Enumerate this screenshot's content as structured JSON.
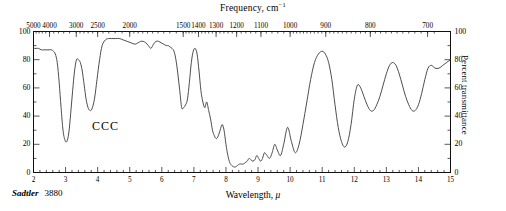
{
  "titles": {
    "top_axis": "Frequency, cm",
    "top_axis_sup": "−1",
    "bottom_axis": "Wavelength, ",
    "bottom_axis_unit": "μ",
    "right_axis": "Percent transmittance"
  },
  "credit": {
    "source": "Sadtler",
    "number": "3880"
  },
  "annotation": {
    "sample_label": "CCC"
  },
  "axes": {
    "y_ticks": [
      "0",
      "20",
      "40",
      "60",
      "80",
      "100"
    ],
    "y_left_labels": [
      "100",
      "80",
      "60",
      "40",
      "20",
      "0"
    ],
    "y_right_labels": [
      "100",
      "80",
      "60",
      "40",
      "20",
      "0"
    ],
    "x_bottom_labels": [
      "2",
      "3",
      "4",
      "5",
      "6",
      "7",
      "8",
      "9",
      "10",
      "11",
      "12",
      "13",
      "14",
      "15"
    ],
    "x_top_labels": [
      "5000",
      "4000",
      "3000",
      "2500",
      "2000",
      "1500",
      "1400",
      "1300",
      "1200",
      "1100",
      "1000",
      "900",
      "800",
      "700"
    ]
  },
  "chart_data": {
    "type": "line",
    "xlabel": "Wavelength, μ",
    "ylabel": "Percent transmittance",
    "x_top_label": "Frequency, cm−1",
    "xlim": [
      2,
      15
    ],
    "ylim": [
      0,
      100
    ],
    "grid": false,
    "legend": null,
    "x_axis_scale": "linear-wavelength",
    "top_axis_ticks_cm1": [
      5000,
      4000,
      3000,
      2500,
      2000,
      1500,
      1400,
      1300,
      1200,
      1100,
      1000,
      900,
      800,
      700
    ],
    "bottom_axis_ticks_um": [
      2,
      3,
      4,
      5,
      6,
      7,
      8,
      9,
      10,
      11,
      12,
      13,
      14,
      15
    ],
    "series": [
      {
        "name": "transmittance",
        "x": [
          2.0,
          2.08,
          2.16,
          2.24,
          2.32,
          2.4,
          2.48,
          2.56,
          2.62,
          2.68,
          2.74,
          2.8,
          2.86,
          2.92,
          2.98,
          3.04,
          3.1,
          3.16,
          3.22,
          3.28,
          3.34,
          3.4,
          3.46,
          3.52,
          3.58,
          3.64,
          3.7,
          3.76,
          3.82,
          3.9,
          3.98,
          4.06,
          4.14,
          4.24,
          4.34,
          4.44,
          4.56,
          4.68,
          4.8,
          4.92,
          5.04,
          5.16,
          5.26,
          5.34,
          5.42,
          5.5,
          5.58,
          5.66,
          5.74,
          5.82,
          5.9,
          5.98,
          6.06,
          6.14,
          6.2,
          6.26,
          6.32,
          6.38,
          6.44,
          6.5,
          6.56,
          6.62,
          6.68,
          6.74,
          6.8,
          6.86,
          6.92,
          6.98,
          7.04,
          7.1,
          7.16,
          7.22,
          7.28,
          7.34,
          7.4,
          7.46,
          7.52,
          7.58,
          7.64,
          7.7,
          7.76,
          7.82,
          7.88,
          7.94,
          8.0,
          8.06,
          8.12,
          8.18,
          8.24,
          8.3,
          8.36,
          8.42,
          8.48,
          8.54,
          8.6,
          8.66,
          8.72,
          8.78,
          8.84,
          8.9,
          8.96,
          9.02,
          9.08,
          9.14,
          9.2,
          9.28,
          9.36,
          9.44,
          9.52,
          9.6,
          9.7,
          9.8,
          9.92,
          10.04,
          10.16,
          10.28,
          10.4,
          10.52,
          10.64,
          10.76,
          10.88,
          11.0,
          11.1,
          11.2,
          11.3,
          11.4,
          11.5,
          11.6,
          11.7,
          11.8,
          11.9,
          12.0,
          12.1,
          12.2,
          12.3,
          12.4,
          12.5,
          12.6,
          12.7,
          12.8,
          12.9,
          13.0,
          13.1,
          13.2,
          13.3,
          13.4,
          13.5,
          13.6,
          13.7,
          13.8,
          13.9,
          14.0,
          14.1,
          14.2,
          14.3,
          14.4,
          14.52,
          14.64,
          14.76,
          14.88,
          15.0
        ],
        "y": [
          88,
          88,
          88,
          87,
          87,
          87,
          87,
          87,
          86,
          84,
          78,
          64,
          46,
          30,
          23,
          22,
          28,
          42,
          58,
          72,
          80,
          80,
          78,
          72,
          62,
          52,
          46,
          44,
          45,
          52,
          66,
          80,
          90,
          94,
          95,
          95,
          95,
          95,
          94,
          93,
          92,
          91,
          92,
          93,
          93,
          92,
          90,
          88,
          91,
          93,
          93,
          92,
          91,
          90,
          90,
          89,
          88,
          86,
          80,
          70,
          58,
          46,
          46,
          48,
          52,
          64,
          78,
          86,
          88,
          84,
          72,
          58,
          50,
          46,
          50,
          44,
          38,
          30,
          26,
          24,
          26,
          30,
          34,
          30,
          20,
          12,
          7,
          5,
          4,
          4,
          5,
          6,
          6,
          6,
          7,
          8,
          10,
          9,
          8,
          9,
          12,
          10,
          8,
          10,
          14,
          12,
          10,
          14,
          20,
          16,
          12,
          20,
          32,
          22,
          14,
          20,
          34,
          50,
          66,
          78,
          84,
          86,
          84,
          78,
          66,
          48,
          32,
          22,
          18,
          22,
          34,
          52,
          62,
          60,
          54,
          48,
          44,
          44,
          48,
          54,
          62,
          70,
          76,
          78,
          76,
          70,
          62,
          54,
          48,
          44,
          44,
          48,
          56,
          66,
          74,
          76,
          74,
          74,
          76,
          78,
          80
        ],
        "color": "#3a3a3a",
        "linewidth": 0.9
      }
    ],
    "notes": [
      {
        "text": "CCC",
        "x": 4.65,
        "y": 32
      }
    ],
    "major_absorption_bands_um": [
      3.0,
      3.78,
      6.65,
      7.7,
      8.3,
      11.7,
      12.6,
      13.7
    ],
    "baseline_percent": 88,
    "source_credit": "Sadtler 3880"
  }
}
